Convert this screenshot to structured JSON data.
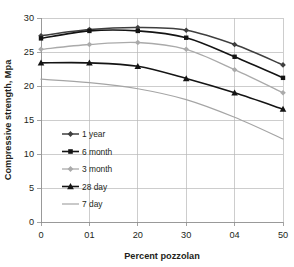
{
  "chart_data": {
    "type": "line",
    "title": "",
    "subtitle": "",
    "xlabel": "Percent pozzolan",
    "ylabel": "Compressive strength, Mpa",
    "x": [
      0,
      10,
      20,
      30,
      40,
      50
    ],
    "categories": [
      "0",
      "01",
      "20",
      "30",
      "04",
      "50"
    ],
    "xtick_labels": [
      "0",
      "01",
      "20",
      "30",
      "04",
      "50"
    ],
    "ytick_labels": [
      "0",
      "5",
      "10",
      "15",
      "20",
      "25",
      "30"
    ],
    "yticks": [
      0,
      5,
      10,
      15,
      20,
      25,
      30
    ],
    "xlim": [
      0,
      50
    ],
    "ylim": [
      0,
      30
    ],
    "grid": true,
    "legend_position": "inside-lower-left",
    "series": [
      {
        "name": "1 year",
        "values": [
          27.4,
          28.3,
          28.6,
          28.2,
          26.1,
          23.1
        ],
        "color": "#3f3f3f",
        "marker": "diamond",
        "line_width": 1.5
      },
      {
        "name": "6 month",
        "values": [
          27.0,
          28.1,
          28.1,
          27.1,
          24.3,
          21.2
        ],
        "color": "#141414",
        "marker": "square",
        "line_width": 1.6
      },
      {
        "name": "3 month",
        "values": [
          25.4,
          26.1,
          26.4,
          25.4,
          22.4,
          19.0
        ],
        "color": "#aaaaaa",
        "marker": "diamond",
        "line_width": 1.3
      },
      {
        "name": "28 day",
        "values": [
          23.4,
          23.4,
          22.9,
          21.1,
          19.0,
          16.6
        ],
        "color": "#141414",
        "marker": "triangle",
        "line_width": 1.6
      },
      {
        "name": "7 day",
        "values": [
          21.0,
          20.5,
          19.6,
          18.0,
          15.4,
          12.2
        ],
        "color": "#a5a5a5",
        "marker": "none",
        "line_width": 1.2
      }
    ]
  },
  "legend": {
    "items": [
      {
        "label": "1 year"
      },
      {
        "label": "6 month"
      },
      {
        "label": "3 month"
      },
      {
        "label": "28 day"
      },
      {
        "label": "7 day"
      }
    ]
  }
}
